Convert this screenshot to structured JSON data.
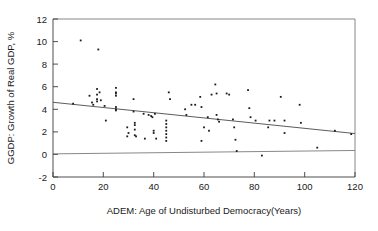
{
  "chart_data": {
    "type": "scatter",
    "title": "",
    "xlabel": "ADEM: Age of Undisturbed Democracy(Years)",
    "ylabel": "GGDP: Growth of Real GDP, %",
    "xlim": [
      0,
      120
    ],
    "ylim": [
      -2,
      12
    ],
    "xticks": [
      0,
      20,
      40,
      60,
      80,
      100,
      120
    ],
    "yticks": [
      -2,
      0,
      2,
      4,
      6,
      8,
      10,
      12
    ],
    "grid": false,
    "legend": null,
    "points": [
      [
        8.0,
        4.5
      ],
      [
        11.0,
        10.1
      ],
      [
        14.5,
        5.2
      ],
      [
        15.5,
        4.6
      ],
      [
        16.0,
        4.4
      ],
      [
        17.5,
        5.8
      ],
      [
        17.5,
        5.3
      ],
      [
        17.5,
        4.9
      ],
      [
        17.5,
        4.7
      ],
      [
        18.0,
        9.3
      ],
      [
        18.5,
        5.5
      ],
      [
        19.0,
        4.8
      ],
      [
        20.5,
        4.3
      ],
      [
        21.0,
        3.0
      ],
      [
        25.0,
        5.9
      ],
      [
        25.0,
        5.5
      ],
      [
        25.0,
        5.4
      ],
      [
        25.0,
        5.2
      ],
      [
        25.0,
        4.2
      ],
      [
        25.0,
        4.0
      ],
      [
        25.0,
        3.9
      ],
      [
        29.5,
        2.4
      ],
      [
        29.5,
        1.6
      ],
      [
        30.0,
        1.9
      ],
      [
        32.0,
        4.9
      ],
      [
        32.0,
        3.8
      ],
      [
        32.5,
        2.8
      ],
      [
        32.5,
        2.6
      ],
      [
        32.5,
        2.2
      ],
      [
        32.5,
        1.7
      ],
      [
        33.0,
        1.6
      ],
      [
        36.0,
        3.6
      ],
      [
        36.5,
        1.4
      ],
      [
        38.0,
        3.5
      ],
      [
        39.0,
        3.4
      ],
      [
        39.5,
        3.3
      ],
      [
        40.0,
        2.1
      ],
      [
        40.0,
        1.9
      ],
      [
        40.5,
        3.6
      ],
      [
        41.0,
        1.4
      ],
      [
        45.0,
        3.0
      ],
      [
        45.0,
        2.7
      ],
      [
        45.0,
        2.4
      ],
      [
        45.0,
        2.1
      ],
      [
        45.0,
        1.8
      ],
      [
        45.0,
        1.5
      ],
      [
        45.0,
        1.2
      ],
      [
        46.0,
        5.5
      ],
      [
        46.5,
        4.9
      ],
      [
        52.5,
        4.0
      ],
      [
        53.0,
        3.5
      ],
      [
        55.0,
        4.4
      ],
      [
        56.5,
        4.4
      ],
      [
        58.5,
        5.1
      ],
      [
        59.0,
        4.2
      ],
      [
        59.0,
        1.2
      ],
      [
        60.0,
        2.4
      ],
      [
        61.5,
        3.3
      ],
      [
        62.0,
        2.1
      ],
      [
        63.0,
        5.3
      ],
      [
        64.5,
        6.2
      ],
      [
        65.0,
        5.4
      ],
      [
        65.0,
        3.5
      ],
      [
        65.5,
        3.1
      ],
      [
        66.0,
        2.9
      ],
      [
        69.0,
        5.4
      ],
      [
        70.0,
        5.3
      ],
      [
        71.5,
        3.1
      ],
      [
        72.0,
        2.4
      ],
      [
        72.5,
        1.3
      ],
      [
        73.0,
        0.3
      ],
      [
        77.5,
        5.7
      ],
      [
        78.0,
        4.1
      ],
      [
        78.5,
        3.3
      ],
      [
        80.5,
        3.0
      ],
      [
        83.0,
        -0.1
      ],
      [
        85.5,
        2.4
      ],
      [
        86.0,
        3.0
      ],
      [
        88.0,
        3.0
      ],
      [
        90.5,
        5.1
      ],
      [
        92.0,
        3.0
      ],
      [
        92.0,
        1.9
      ],
      [
        98.0,
        4.4
      ],
      [
        98.5,
        2.8
      ],
      [
        105.0,
        0.6
      ],
      [
        112.0,
        2.1
      ],
      [
        118.5,
        1.8
      ]
    ],
    "fit_line": {
      "name": "regression-line",
      "x": [
        0,
        120
      ],
      "y": [
        4.62,
        1.85
      ]
    },
    "reference_line": {
      "name": "zero-reference-line",
      "x": [
        0,
        120
      ],
      "y": [
        0.05,
        0.35
      ]
    }
  }
}
